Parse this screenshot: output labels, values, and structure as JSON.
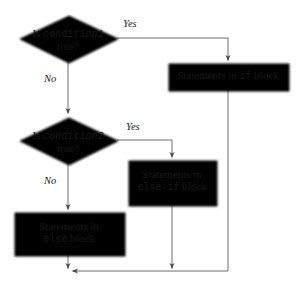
{
  "diagram": {
    "colors": {
      "node_fill": "#c9c9c9",
      "node_stroke": "#6b6b6b",
      "edge_stroke": "#6e6e6e",
      "text": "#1a1a1a",
      "background": "#ffffff"
    },
    "decisions": [
      {
        "id": "condition1",
        "line1_prefix": "Is ",
        "line1_code": "condition1",
        "line2": "true?",
        "yes_label": "Yes",
        "no_label": "No"
      },
      {
        "id": "condition2",
        "line1_prefix": "Is ",
        "line1_code": "condition2",
        "line2": "true?",
        "yes_label": "Yes",
        "no_label": "No"
      }
    ],
    "processes": [
      {
        "id": "if-block",
        "prefix": "Statements in ",
        "code": "if",
        "suffix": " block"
      },
      {
        "id": "else-if-block",
        "prefix": "Statements in",
        "code": "else-if",
        "suffix": " block"
      },
      {
        "id": "else-block",
        "prefix": "Statements in",
        "code": "else",
        "suffix": " block"
      }
    ]
  }
}
